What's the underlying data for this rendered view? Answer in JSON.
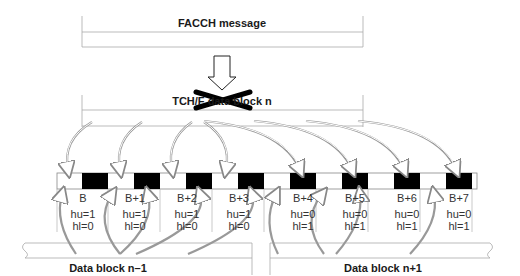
{
  "diagram": {
    "top_block": {
      "label": "FACCH message"
    },
    "middle_block": {
      "label": "TCH/F data block n",
      "crossed_out": true
    },
    "bursts": [
      {
        "label": "B",
        "hu": "hu=1",
        "hl": "hl=0"
      },
      {
        "label": "B+1",
        "hu": "hu=1",
        "hl": "hl=0"
      },
      {
        "label": "B+2",
        "hu": "hu=1",
        "hl": "hl=0"
      },
      {
        "label": "B+3",
        "hu": "hu=1",
        "hl": "hl=0"
      },
      {
        "label": "B+4",
        "hu": "hu=0",
        "hl": "hl=1"
      },
      {
        "label": "B+5",
        "hu": "hu=0",
        "hl": "hl=1"
      },
      {
        "label": "B+6",
        "hu": "hu=0",
        "hl": "hl=1"
      },
      {
        "label": "B+7",
        "hu": "hu=0",
        "hl": "hl=1"
      }
    ],
    "bottom_left": {
      "label": "Data block n–1"
    },
    "bottom_right": {
      "label": "Data block n+1"
    },
    "colors": {
      "stroke": "#9a9a9a",
      "burst_fill": "#000000",
      "text": "#1a1a1a"
    }
  }
}
